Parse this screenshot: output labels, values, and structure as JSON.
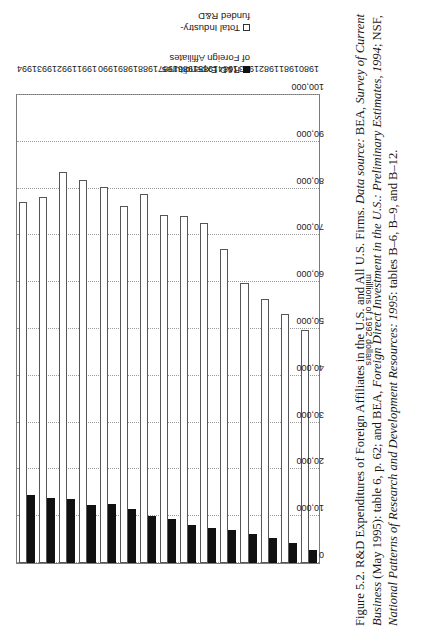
{
  "figure": {
    "caption_lines": [
      "Figure 5.2. R&D Expenditures of Foreign Affiliates in the U.S. and All U.S. Firms. Data source: BEA, Survey of Current",
      "Business (May 1995): table 6, p. 62; and BEA, Foreign Direct Investment in the U.S.: Preliminary Estimates, 1994; NSF,",
      "National Patterns of Research and Development Resources: 1995: tables B–6, B–9, and B–12."
    ],
    "caption_label": "Figure 5.2.",
    "caption_title": "R&D Expenditures of Foreign Affiliates in the U.S. and All U.S. Firms.",
    "data_source_label": "Data source:"
  },
  "legend": {
    "position": "right",
    "items": [
      {
        "label": "R&D Expenditures\nof Foreign Affiliates",
        "line1": "R&D Expenditures",
        "line2": "of Foreign Affiliates",
        "swatch": "filled-black-square",
        "color": "#111111"
      },
      {
        "label": "Total Industry-\nfunded R&D",
        "line1": "Total Industry-",
        "line2": "funded R&D",
        "swatch": "open-white-square",
        "color": "#ffffff"
      }
    ]
  },
  "chart_data": {
    "type": "bar",
    "orientation": "horizontal",
    "title": "",
    "xlabel": "",
    "ylabel": "millions of 1992 dollars",
    "categories": [
      "1980",
      "1981",
      "1982",
      "1983",
      "1984",
      "1985",
      "1986",
      "1987",
      "1988",
      "1989",
      "1990",
      "1991",
      "1992",
      "1993",
      "1994"
    ],
    "ylim": [
      0,
      100000
    ],
    "ticks": [
      0,
      10000,
      20000,
      30000,
      40000,
      50000,
      60000,
      70000,
      80000,
      90000,
      100000
    ],
    "tick_labels": [
      "0",
      "10,000",
      "20,000",
      "30,000",
      "40,000",
      "50,000",
      "60,000",
      "70,000",
      "80,000",
      "90,000",
      "100,000"
    ],
    "grid": true,
    "series": [
      {
        "name": "Total Industry-funded R&D",
        "color": "#ffffff",
        "values": [
          49800,
          53200,
          56500,
          59800,
          67200,
          72700,
          74100,
          74400,
          78900,
          76200,
          80300,
          81900,
          83600,
          78200,
          77100
        ]
      },
      {
        "name": "R&D Expenditures of Foreign Affiliates",
        "color": "#111111",
        "values": [
          2700,
          4300,
          5400,
          6200,
          7100,
          7500,
          8100,
          9400,
          10100,
          11500,
          12600,
          12300,
          13700,
          13900,
          14500
        ]
      }
    ]
  }
}
